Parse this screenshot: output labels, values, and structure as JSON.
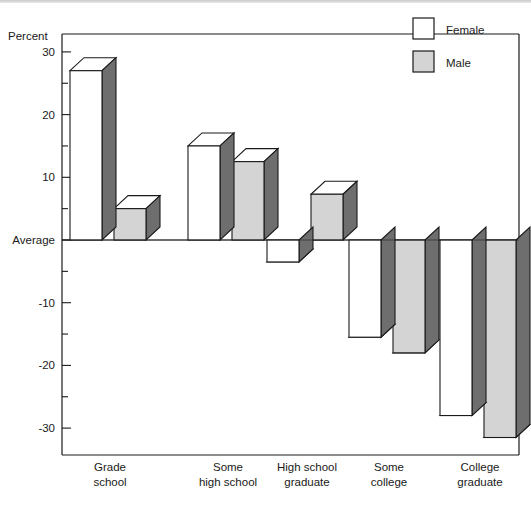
{
  "chart_data": {
    "type": "bar",
    "title": "",
    "xlabel": "",
    "ylabel": "Percent",
    "ylim": [
      -33,
      32
    ],
    "grid": false,
    "legend_position": "top-right",
    "zero_label": "Average",
    "categories": [
      "Grade school",
      "Some high school",
      "High school graduate",
      "Some college",
      "College graduate"
    ],
    "category_lines": [
      [
        "Grade",
        "school"
      ],
      [
        "Some",
        "high school"
      ],
      [
        "High school",
        "graduate"
      ],
      [
        "Some",
        "college"
      ],
      [
        "College",
        "graduate"
      ]
    ],
    "series": [
      {
        "name": "Female",
        "color": "#ffffff",
        "values": [
          27,
          15,
          -3.5,
          -15.5,
          -28
        ]
      },
      {
        "name": "Male",
        "color": "#d4d4d4",
        "values": [
          5,
          12.5,
          7.3,
          -18,
          -31.5
        ]
      }
    ],
    "ytick_values": [
      30,
      25,
      20,
      15,
      10,
      5,
      0,
      -5,
      -10,
      -15,
      -20,
      -25,
      -30
    ],
    "ytick_labels": [
      "30",
      "",
      "20",
      "",
      "10",
      "",
      "Average",
      "",
      "-10",
      "",
      "-20",
      "",
      "-30"
    ],
    "side_face_color": "#6e6e6e",
    "outline_color": "#1a1a1a"
  },
  "legend": {
    "items": [
      {
        "label": "Female",
        "swatch": "#ffffff"
      },
      {
        "label": "Male",
        "swatch": "#d4d4d4"
      }
    ]
  },
  "axis": {
    "ylabel": "Percent"
  }
}
